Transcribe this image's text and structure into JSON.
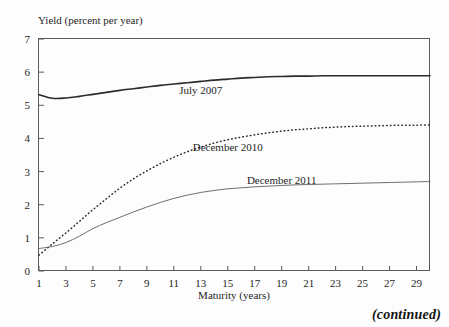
{
  "chart_data": {
    "type": "line",
    "title": "",
    "xlabel": "Maturity (years)",
    "ylabel": "Yield (percent per year)",
    "xlim": [
      1,
      30
    ],
    "ylim": [
      0,
      7
    ],
    "grid": false,
    "legend_position": "inline-annotations",
    "xticks": [
      1,
      3,
      5,
      7,
      9,
      11,
      13,
      15,
      17,
      19,
      21,
      23,
      25,
      27,
      29
    ],
    "yticks": [
      0,
      1,
      2,
      3,
      4,
      5,
      6,
      7
    ],
    "x": [
      1,
      2,
      3,
      4,
      5,
      6,
      7,
      8,
      9,
      10,
      11,
      12,
      13,
      14,
      15,
      16,
      17,
      18,
      19,
      20,
      21,
      22,
      23,
      24,
      25,
      26,
      27,
      28,
      29,
      30
    ],
    "series": [
      {
        "name": "July 2007",
        "style": "solid-thick",
        "values": [
          5.32,
          5.21,
          5.22,
          5.27,
          5.33,
          5.39,
          5.45,
          5.5,
          5.55,
          5.6,
          5.64,
          5.68,
          5.72,
          5.76,
          5.79,
          5.82,
          5.84,
          5.86,
          5.87,
          5.88,
          5.88,
          5.89,
          5.89,
          5.89,
          5.89,
          5.89,
          5.89,
          5.89,
          5.89,
          5.89
        ],
        "label_x": 13,
        "label_y": 5.35
      },
      {
        "name": "December 2010",
        "style": "dotted",
        "values": [
          0.48,
          0.82,
          1.15,
          1.5,
          1.85,
          2.18,
          2.5,
          2.78,
          3.02,
          3.24,
          3.43,
          3.6,
          3.74,
          3.86,
          3.96,
          4.04,
          4.11,
          4.17,
          4.22,
          4.26,
          4.29,
          4.32,
          4.34,
          4.36,
          4.37,
          4.38,
          4.39,
          4.4,
          4.4,
          4.41
        ],
        "label_x": 15,
        "label_y": 3.62
      },
      {
        "name": "December 2011",
        "style": "solid-thin",
        "values": [
          0.68,
          0.74,
          0.86,
          1.05,
          1.28,
          1.46,
          1.62,
          1.78,
          1.93,
          2.07,
          2.19,
          2.29,
          2.37,
          2.43,
          2.48,
          2.51,
          2.54,
          2.56,
          2.58,
          2.6,
          2.61,
          2.62,
          2.63,
          2.64,
          2.65,
          2.66,
          2.67,
          2.68,
          2.69,
          2.7
        ],
        "label_x": 19,
        "label_y": 2.64
      }
    ]
  },
  "footer": {
    "continued_note": "(continued)"
  }
}
